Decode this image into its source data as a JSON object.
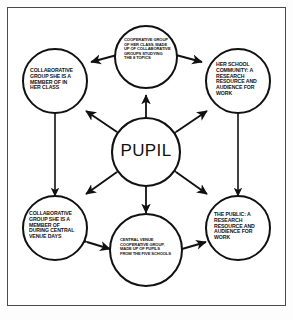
{
  "figure": {
    "type": "network-diagram",
    "title": "",
    "background_color": "#ffffff",
    "frame_color": "#4a4a4a",
    "stroke_color": "#111111"
  },
  "nodes": {
    "center": {
      "id": "pupil",
      "label": "PUPIL",
      "role": "central-node"
    },
    "top": {
      "id": "cooperative-group-class",
      "label": "COOPERATIVE GROUP\nOF HER CLASS, MADE\nUP OF COLLABORATIVE\nGROUPS STUDYING\nTHE 8 TOPICS"
    },
    "left": {
      "id": "collaborative-group-class",
      "label": "COLLABORATIVE\nGROUP SHE IS A\nMEMBER OF IN\nHER CLASS"
    },
    "right": {
      "id": "school-community",
      "label": "HER SCHOOL\nCOMMUNITY: A\nRESEARCH\nRESOURCE AND\nAUDIENCE FOR\nWORK"
    },
    "bottom_left": {
      "id": "collaborative-group-central-venue",
      "label": "COLLABORATIVE\nGROUP SHE IS A\nMEMBER OF\nDURING CENTRAL\nVENUE DAYS"
    },
    "bottom_right": {
      "id": "the-public",
      "label": "THE PUBLIC: A\nRESEARCH\nRESOURCE AND\nAUDIENCE FOR\nWORK"
    },
    "bottom": {
      "id": "central-venue-cooperative-group",
      "label": "CENTRAL VENUE\nCOOPERATIVE GROUP,\nMADE UP OF PUPILS\nFROM THE FIVE SCHOOLS"
    }
  },
  "connections": [
    {
      "from": "pupil",
      "to": "cooperative-group-class",
      "style": "double-arrow"
    },
    {
      "from": "pupil",
      "to": "collaborative-group-class",
      "style": "double-arrow"
    },
    {
      "from": "pupil",
      "to": "school-community",
      "style": "double-arrow"
    },
    {
      "from": "pupil",
      "to": "central-venue-cooperative-group",
      "style": "double-arrow"
    },
    {
      "from": "pupil",
      "to": "collaborative-group-central-venue",
      "style": "double-arrow"
    },
    {
      "from": "pupil",
      "to": "the-public",
      "style": "double-arrow"
    },
    {
      "from": "cooperative-group-class",
      "to": "collaborative-group-class",
      "style": "double-arrow"
    },
    {
      "from": "cooperative-group-class",
      "to": "school-community",
      "style": "double-arrow"
    },
    {
      "from": "collaborative-group-class",
      "to": "collaborative-group-central-venue",
      "style": "double-arrow"
    },
    {
      "from": "school-community",
      "to": "the-public",
      "style": "double-arrow"
    },
    {
      "from": "collaborative-group-central-venue",
      "to": "central-venue-cooperative-group",
      "style": "double-arrow"
    },
    {
      "from": "central-venue-cooperative-group",
      "to": "the-public",
      "style": "double-arrow"
    }
  ]
}
